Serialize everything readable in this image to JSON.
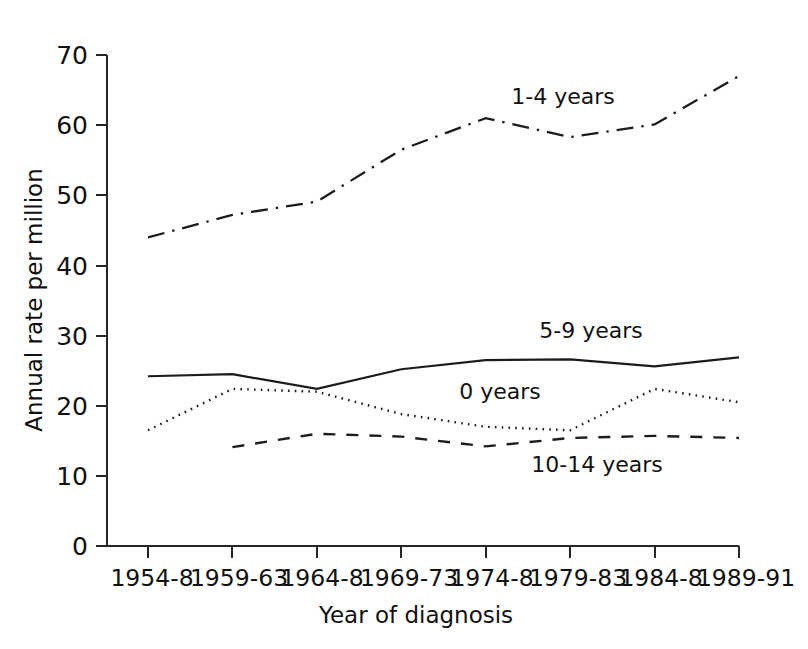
{
  "chart_data": {
    "type": "line",
    "title": "",
    "xlabel": "Year of diagnosis",
    "ylabel": "Annual rate per million",
    "categories": [
      "1954-8",
      "1959-63",
      "1964-8",
      "1969-73",
      "1974-8",
      "1979-83",
      "1984-8",
      "1989-91"
    ],
    "ylim": [
      0,
      70
    ],
    "yticks": [
      0,
      10,
      20,
      30,
      40,
      50,
      60,
      70
    ],
    "grid": false,
    "legend_position": "inline-annotations",
    "series": [
      {
        "name": "1-4 years",
        "line_style": "dash-dot",
        "values": [
          44.0,
          47.2,
          49.1,
          56.5,
          61.0,
          58.3,
          60.1,
          67.0
        ]
      },
      {
        "name": "5-9 years",
        "line_style": "solid",
        "values": [
          24.2,
          24.5,
          22.4,
          25.2,
          26.5,
          26.6,
          25.6,
          26.9
        ]
      },
      {
        "name": "0 years",
        "line_style": "dotted",
        "values": [
          16.5,
          22.4,
          22.0,
          18.8,
          17.0,
          16.5,
          22.4,
          20.5
        ]
      },
      {
        "name": "10-14 years",
        "line_style": "dashed",
        "values": [
          null,
          14.1,
          16.0,
          15.6,
          14.2,
          15.4,
          15.7,
          15.4
        ]
      }
    ],
    "annotations": [
      {
        "text": "1-4 years",
        "x_px": 563,
        "y_px": 104
      },
      {
        "text": "5-9 years",
        "x_px": 591,
        "y_px": 338
      },
      {
        "text": "0 years",
        "x_px": 500,
        "y_px": 399
      },
      {
        "text": "10-14 years",
        "x_px": 597,
        "y_px": 472
      }
    ]
  },
  "axes": {
    "y_tick_labels": [
      "70",
      "60",
      "50",
      "40",
      "30",
      "20",
      "10",
      "0"
    ],
    "x_tick_labels": [
      "1954-8",
      "1959-63",
      "1964-8",
      "1969-73",
      "1974-8",
      "1979-83",
      "1984-8",
      "1989-91"
    ],
    "y_axis_title": "Annual rate per million",
    "x_axis_title": "Year of diagnosis"
  },
  "colors": {
    "ink": "#1c1c1c",
    "background": "#ffffff"
  }
}
